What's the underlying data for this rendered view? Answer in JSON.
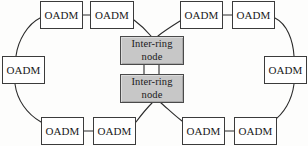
{
  "diagram": {
    "canvas": {
      "width": 308,
      "height": 146,
      "background": "#fdfdfc"
    },
    "style": {
      "oadm_fill": "#ffffff",
      "oadm_stroke": "#3b3b3b",
      "inter_fill": "#c7c7c7",
      "inter_stroke": "#4a4a4a",
      "link_stroke": "#2b2b2b",
      "link_width": 1
    },
    "nodes": [
      {
        "id": "oadm-top-left-1",
        "label": "OADM",
        "x": 40,
        "y": 1,
        "w": 43,
        "h": 28,
        "type": "oadm"
      },
      {
        "id": "oadm-top-left-2",
        "label": "OADM",
        "x": 90,
        "y": 1,
        "w": 44,
        "h": 28,
        "type": "oadm"
      },
      {
        "id": "oadm-top-right-1",
        "label": "OADM",
        "x": 180,
        "y": 1,
        "w": 43,
        "h": 28,
        "type": "oadm"
      },
      {
        "id": "oadm-top-right-2",
        "label": "OADM",
        "x": 232,
        "y": 1,
        "w": 43,
        "h": 28,
        "type": "oadm"
      },
      {
        "id": "oadm-left",
        "label": "OADM",
        "x": 2,
        "y": 56,
        "w": 43,
        "h": 28,
        "type": "oadm"
      },
      {
        "id": "oadm-right",
        "label": "OADM",
        "x": 264,
        "y": 56,
        "w": 43,
        "h": 28,
        "type": "oadm"
      },
      {
        "id": "oadm-bottom-left-1",
        "label": "OADM",
        "x": 41,
        "y": 117,
        "w": 43,
        "h": 28,
        "type": "oadm"
      },
      {
        "id": "oadm-bottom-left-2",
        "label": "OADM",
        "x": 93,
        "y": 117,
        "w": 43,
        "h": 28,
        "type": "oadm"
      },
      {
        "id": "oadm-bottom-right-1",
        "label": "OADM",
        "x": 182,
        "y": 117,
        "w": 43,
        "h": 28,
        "type": "oadm"
      },
      {
        "id": "oadm-bottom-right-2",
        "label": "OADM",
        "x": 234,
        "y": 117,
        "w": 43,
        "h": 28,
        "type": "oadm"
      },
      {
        "id": "inter-ring-node-top",
        "label_line1": "Inter-ring",
        "label_line2": "node",
        "x": 120,
        "y": 36,
        "w": 64,
        "h": 29,
        "type": "inter"
      },
      {
        "id": "inter-ring-node-bottom",
        "label_line1": "Inter-ring",
        "label_line2": "node",
        "x": 120,
        "y": 74,
        "w": 64,
        "h": 29,
        "type": "inter"
      }
    ],
    "links": [
      {
        "from": "oadm-top-left-1",
        "to": "oadm-top-left-2",
        "kind": "straight"
      },
      {
        "from": "oadm-top-right-1",
        "to": "oadm-top-right-2",
        "kind": "straight"
      },
      {
        "from": "oadm-bottom-left-1",
        "to": "oadm-bottom-left-2",
        "kind": "straight"
      },
      {
        "from": "oadm-bottom-right-1",
        "to": "oadm-bottom-right-2",
        "kind": "straight"
      },
      {
        "from": "inter-ring-node-top",
        "to": "inter-ring-node-bottom",
        "kind": "double-vertical"
      },
      {
        "from": "oadm-top-left-1",
        "to": "oadm-left",
        "kind": "arc"
      },
      {
        "from": "oadm-left",
        "to": "oadm-bottom-left-1",
        "kind": "arc"
      },
      {
        "from": "oadm-top-left-2",
        "to": "inter-ring-node-top",
        "kind": "arc"
      },
      {
        "from": "oadm-bottom-left-2",
        "to": "inter-ring-node-bottom",
        "kind": "arc"
      },
      {
        "from": "oadm-top-right-2",
        "to": "oadm-right",
        "kind": "arc"
      },
      {
        "from": "oadm-right",
        "to": "oadm-bottom-right-2",
        "kind": "arc"
      },
      {
        "from": "oadm-top-right-1",
        "to": "inter-ring-node-top",
        "kind": "arc"
      },
      {
        "from": "oadm-bottom-right-1",
        "to": "inter-ring-node-bottom",
        "kind": "arc"
      }
    ]
  }
}
